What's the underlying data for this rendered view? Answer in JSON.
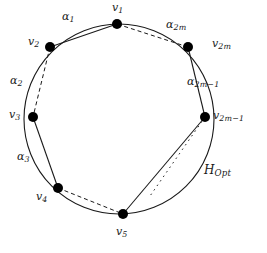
{
  "figure": {
    "title_label": "H_Opt",
    "colors": {
      "stroke": "#1a1a1a",
      "node_fill": "#000000",
      "background": "#ffffff"
    },
    "circle": {
      "cx": 119,
      "cy": 119,
      "r": 95
    },
    "vertices": [
      {
        "id": "v1",
        "label": "v",
        "sub": "1",
        "x": 117,
        "y": 24,
        "label_x": 112,
        "label_y": 4
      },
      {
        "id": "v2",
        "label": "v",
        "sub": "2",
        "x": 50,
        "y": 47,
        "label_x": 28,
        "label_y": 38
      },
      {
        "id": "v3",
        "label": "v",
        "sub": "3",
        "x": 33,
        "y": 117,
        "label_x": 9,
        "label_y": 110
      },
      {
        "id": "v4",
        "label": "v",
        "sub": "4",
        "x": 58,
        "y": 188,
        "label_x": 36,
        "label_y": 192
      },
      {
        "id": "v5",
        "label": "v",
        "sub": "5",
        "x": 123,
        "y": 214,
        "label_x": 116,
        "label_y": 227
      },
      {
        "id": "v2m1",
        "label": "v",
        "sub": "2m−1",
        "x": 205,
        "y": 117,
        "label_x": 214,
        "label_y": 111
      },
      {
        "id": "v2m",
        "label": "v",
        "sub": "2m",
        "x": 188,
        "y": 47,
        "label_x": 212,
        "label_y": 39
      }
    ],
    "arc_labels": [
      {
        "id": "a1",
        "label": "α",
        "sub": "1",
        "x": 62,
        "y": 12
      },
      {
        "id": "a2",
        "label": "α",
        "sub": "2",
        "x": 10,
        "y": 76
      },
      {
        "id": "a3",
        "label": "α",
        "sub": "3",
        "x": 17,
        "y": 152
      },
      {
        "id": "a2m",
        "label": "α",
        "sub": "2m",
        "x": 166,
        "y": 20
      },
      {
        "id": "a2m1",
        "label": "α",
        "sub": "2m−1",
        "x": 188,
        "y": 77
      }
    ],
    "hopt_label": {
      "label": "H",
      "sub": "Opt",
      "x": 206,
      "y": 166
    },
    "chords": [
      {
        "from": "v1",
        "to": "v2",
        "style": "solid"
      },
      {
        "from": "v2",
        "to": "v3",
        "style": "dashed"
      },
      {
        "from": "v3",
        "to": "v4",
        "style": "solid"
      },
      {
        "from": "v4",
        "to": "v5",
        "style": "dashed"
      },
      {
        "from": "v5",
        "to": "v2m1",
        "style": "solid"
      },
      {
        "from": "v2m1",
        "to": "v2m",
        "style": "solid"
      },
      {
        "from": "v2m",
        "to": "v1",
        "style": "dashed"
      }
    ]
  }
}
